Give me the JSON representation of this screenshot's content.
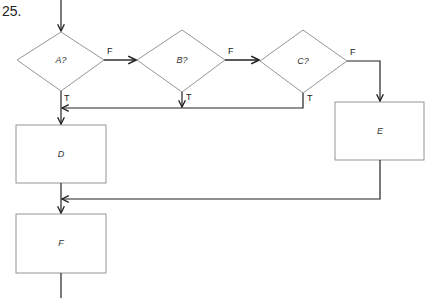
{
  "problem_number": "25.",
  "colors": {
    "shape_stroke": "#8a8a8a",
    "line_stroke": "#222222",
    "background": "#ffffff"
  },
  "nodes": {
    "decision_a": {
      "type": "decision",
      "label": "A?"
    },
    "decision_b": {
      "type": "decision",
      "label": "B?"
    },
    "decision_c": {
      "type": "decision",
      "label": "C?"
    },
    "process_d": {
      "type": "process",
      "label": "D"
    },
    "process_e": {
      "type": "process",
      "label": "E"
    },
    "process_f": {
      "type": "process",
      "label": "F"
    }
  },
  "edges": {
    "a_false": {
      "from": "A?",
      "to": "B?",
      "label": "F"
    },
    "a_true": {
      "from": "A?",
      "to": "D",
      "label": "T"
    },
    "b_false": {
      "from": "B?",
      "to": "C?",
      "label": "F"
    },
    "b_true": {
      "from": "B?",
      "to": "D",
      "label": "T"
    },
    "c_false": {
      "from": "C?",
      "to": "E",
      "label": "F"
    },
    "c_true": {
      "from": "C?",
      "to": "D",
      "label": "T"
    },
    "d_to_f": {
      "from": "D",
      "to": "F",
      "label": ""
    },
    "e_to_f": {
      "from": "E",
      "to": "F",
      "label": ""
    }
  }
}
